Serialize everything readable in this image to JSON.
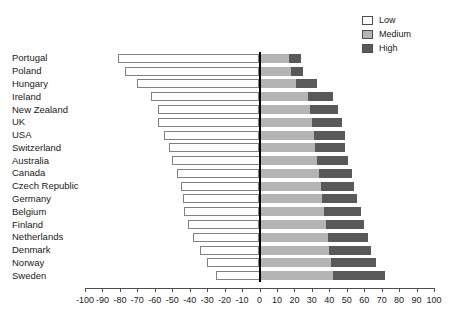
{
  "chart_data": {
    "type": "bar",
    "orientation": "horizontal",
    "layout": "diverging-stacked",
    "title": "",
    "subtitle": "",
    "xlabel": "",
    "ylabel": "",
    "xlim": [
      -100,
      100
    ],
    "xticks": [
      -100,
      -90,
      -80,
      -70,
      -60,
      -50,
      -40,
      -30,
      -20,
      -10,
      0,
      10,
      20,
      30,
      40,
      50,
      60,
      70,
      80,
      90,
      100
    ],
    "xtick_labels": [
      "-100",
      "-90",
      "-80",
      "-70",
      "-60",
      "-50",
      "-40",
      "-30",
      "-20",
      "-10",
      "0",
      "10",
      "20",
      "30",
      "40",
      "50",
      "60",
      "70",
      "80",
      "90",
      "100"
    ],
    "grid": false,
    "legend_position": "top-right",
    "categories": [
      "Portugal",
      "Poland",
      "Hungary",
      "Ireland",
      "New Zealand",
      "UK",
      "USA",
      "Switzerland",
      "Australia",
      "Canada",
      "Czech Republic",
      "Germany",
      "Belgium",
      "Finland",
      "Netherlands",
      "Denmark",
      "Norway",
      "Sweden"
    ],
    "series": [
      {
        "name": "Low",
        "color": "#ffffff",
        "direction": "left",
        "values": [
          -81,
          -77,
          -70,
          -62,
          -58,
          -58,
          -55,
          -52,
          -50,
          -47,
          -45,
          -44,
          -43,
          -41,
          -38,
          -34,
          -30,
          -25
        ]
      },
      {
        "name": "Medium",
        "color": "#b4b4b4",
        "direction": "right",
        "values": [
          17,
          18,
          21,
          28,
          29,
          30,
          31,
          32,
          33,
          34,
          35,
          36,
          37,
          38,
          39,
          40,
          41,
          42
        ]
      },
      {
        "name": "High",
        "color": "#595959",
        "direction": "right",
        "values": [
          7,
          7,
          12,
          14,
          16,
          17,
          18,
          17,
          18,
          19,
          19,
          20,
          21,
          22,
          23,
          24,
          26,
          30
        ]
      }
    ]
  },
  "legend": {
    "items": [
      {
        "label": "Low",
        "swatch": "low"
      },
      {
        "label": "Medium",
        "swatch": "medium"
      },
      {
        "label": "High",
        "swatch": "high"
      }
    ]
  }
}
